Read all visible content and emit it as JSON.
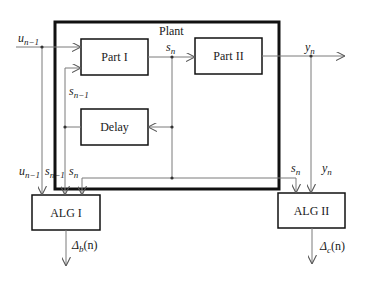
{
  "diagram": {
    "type": "block-diagram",
    "plant": {
      "label": "Plant"
    },
    "blocks": {
      "part1": {
        "label": "Part I"
      },
      "part2": {
        "label": "Part II"
      },
      "delay": {
        "label": "Delay"
      },
      "alg1": {
        "label": "ALG I"
      },
      "alg2": {
        "label": "ALG II"
      }
    },
    "signals": {
      "u_prev": {
        "base": "u",
        "sub": "n−1"
      },
      "s_n": {
        "base": "s",
        "sub": "n"
      },
      "s_prev": {
        "base": "s",
        "sub": "n−1"
      },
      "y_n": {
        "base": "y",
        "sub": "n"
      }
    },
    "outputs": {
      "delta_b": {
        "base": "Δ",
        "sub": "b",
        "arg": "(n)"
      },
      "delta_c": {
        "base": "Δ",
        "sub": "c",
        "arg": "(n)"
      }
    },
    "connections": [
      {
        "from": "u_prev input",
        "to": "Part I"
      },
      {
        "from": "Part I",
        "to": "Part II",
        "signal": "s_n"
      },
      {
        "from": "Part II",
        "to": "output",
        "signal": "y_n"
      },
      {
        "from": "s_n",
        "to": "Delay"
      },
      {
        "from": "Delay",
        "to": "Part I",
        "signal": "s_n−1"
      },
      {
        "from": "u_n−1, s_n−1, s_n",
        "to": "ALG I"
      },
      {
        "from": "s_n, y_n",
        "to": "ALG II"
      },
      {
        "from": "ALG I",
        "to": "output",
        "signal": "Δ_b(n)"
      },
      {
        "from": "ALG II",
        "to": "output",
        "signal": "Δ_c(n)"
      }
    ],
    "colors": {
      "line": "#7a7a7a",
      "box": "#1a1a1a",
      "text": "#1a1a1a"
    }
  }
}
